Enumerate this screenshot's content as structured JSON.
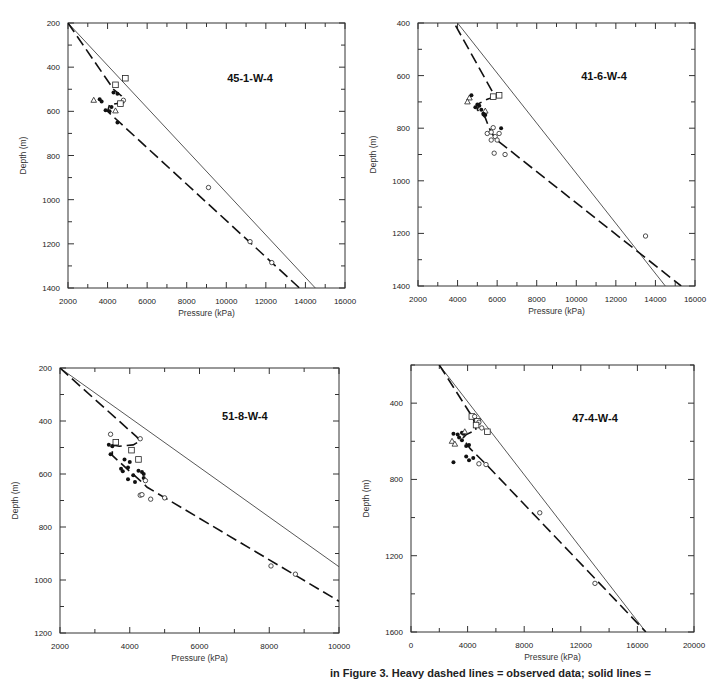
{
  "figure": {
    "caption_partial": "in Figure 3. Heavy dashed lines = observed data; solid lines ="
  },
  "chart_data": [
    {
      "type": "scatter",
      "title": "45-1-W-4",
      "xlabel": "Pressure (kPa)",
      "ylabel": "Depth (m)",
      "xlim": [
        2000,
        16000
      ],
      "ylim": [
        200,
        1400
      ],
      "y_inverted": true,
      "xticks": [
        2000,
        4000,
        6000,
        8000,
        10000,
        12000,
        14000,
        16000
      ],
      "yticks": [
        200,
        400,
        600,
        800,
        1000,
        1200,
        1400
      ],
      "box": {
        "left": 68,
        "right": 345,
        "top": 23,
        "bottom": 288
      },
      "title_pos": {
        "x": 11200,
        "y": 450
      },
      "solid_line": [
        [
          2000,
          200
        ],
        [
          14500,
          1400
        ]
      ],
      "dashed_line": [
        [
          2000,
          200
        ],
        [
          4300,
          500
        ],
        [
          4700,
          530
        ],
        [
          4800,
          560
        ],
        [
          4100,
          570
        ],
        [
          4000,
          600
        ],
        [
          13700,
          1400
        ]
      ],
      "points": [
        {
          "shape": "square",
          "x": 4900,
          "y": 450
        },
        {
          "shape": "square",
          "x": 4400,
          "y": 480
        },
        {
          "shape": "circle-filled",
          "x": 4300,
          "y": 515
        },
        {
          "shape": "circle-filled",
          "x": 4500,
          "y": 520
        },
        {
          "shape": "triangle",
          "x": 3300,
          "y": 550
        },
        {
          "shape": "circle-filled",
          "x": 3600,
          "y": 545
        },
        {
          "shape": "circle-filled",
          "x": 3700,
          "y": 555
        },
        {
          "shape": "circle",
          "x": 4800,
          "y": 550
        },
        {
          "shape": "square",
          "x": 4650,
          "y": 565
        },
        {
          "shape": "circle-filled",
          "x": 4200,
          "y": 580
        },
        {
          "shape": "circle-filled",
          "x": 3900,
          "y": 595
        },
        {
          "shape": "circle-filled",
          "x": 4100,
          "y": 600
        },
        {
          "shape": "triangle",
          "x": 4400,
          "y": 598
        },
        {
          "shape": "circle-filled",
          "x": 4500,
          "y": 650
        },
        {
          "shape": "circle",
          "x": 9100,
          "y": 945
        },
        {
          "shape": "circle",
          "x": 11200,
          "y": 1190
        },
        {
          "shape": "circle",
          "x": 12300,
          "y": 1285
        }
      ]
    },
    {
      "type": "scatter",
      "title": "41-6-W-4",
      "xlabel": "Pressure (kPa)",
      "ylabel": "Depth (m)",
      "xlim": [
        2000,
        16000
      ],
      "ylim": [
        400,
        1400
      ],
      "y_inverted": true,
      "xticks": [
        2000,
        4000,
        6000,
        8000,
        10000,
        12000,
        14000,
        16000
      ],
      "yticks": [
        400,
        600,
        800,
        1000,
        1200,
        1400
      ],
      "box": {
        "left": 418,
        "right": 695,
        "top": 23,
        "bottom": 286
      },
      "title_pos": {
        "x": 11400,
        "y": 600
      },
      "solid_line": [
        [
          4000,
          400
        ],
        [
          14500,
          1400
        ]
      ],
      "dashed_line": [
        [
          3900,
          410
        ],
        [
          5900,
          680
        ],
        [
          5500,
          690
        ],
        [
          5100,
          705
        ],
        [
          5000,
          730
        ],
        [
          5400,
          760
        ],
        [
          5600,
          800
        ],
        [
          5900,
          840
        ],
        [
          15300,
          1400
        ]
      ],
      "points": [
        {
          "shape": "square",
          "x": 6100,
          "y": 675
        },
        {
          "shape": "square",
          "x": 5800,
          "y": 680
        },
        {
          "shape": "triangle",
          "x": 4600,
          "y": 685
        },
        {
          "shape": "circle-filled",
          "x": 4700,
          "y": 675
        },
        {
          "shape": "triangle",
          "x": 4500,
          "y": 700
        },
        {
          "shape": "circle-filled",
          "x": 5000,
          "y": 710
        },
        {
          "shape": "circle-filled",
          "x": 5100,
          "y": 715
        },
        {
          "shape": "circle-filled",
          "x": 4900,
          "y": 720
        },
        {
          "shape": "circle-filled",
          "x": 5200,
          "y": 730
        },
        {
          "shape": "triangle",
          "x": 5400,
          "y": 735
        },
        {
          "shape": "circle-filled",
          "x": 5300,
          "y": 745
        },
        {
          "shape": "circle-filled",
          "x": 5400,
          "y": 750
        },
        {
          "shape": "circle",
          "x": 5800,
          "y": 798
        },
        {
          "shape": "circle-filled",
          "x": 6200,
          "y": 800
        },
        {
          "shape": "circle",
          "x": 5500,
          "y": 820
        },
        {
          "shape": "circle",
          "x": 5700,
          "y": 815
        },
        {
          "shape": "circle",
          "x": 6100,
          "y": 820
        },
        {
          "shape": "circle",
          "x": 5900,
          "y": 832
        },
        {
          "shape": "circle",
          "x": 5700,
          "y": 845
        },
        {
          "shape": "circle",
          "x": 6000,
          "y": 845
        },
        {
          "shape": "circle",
          "x": 5850,
          "y": 895
        },
        {
          "shape": "circle",
          "x": 6400,
          "y": 900
        },
        {
          "shape": "circle",
          "x": 13500,
          "y": 1210
        }
      ]
    },
    {
      "type": "scatter",
      "title": "51-8-W-4",
      "xlabel": "Pressure (kPa)",
      "ylabel": "Depth (m)",
      "xlim": [
        2000,
        10000
      ],
      "ylim": [
        200,
        1200
      ],
      "y_inverted": true,
      "xticks": [
        2000,
        4000,
        6000,
        8000,
        10000
      ],
      "yticks": [
        200,
        400,
        600,
        800,
        1000,
        1200
      ],
      "box": {
        "left": 60,
        "right": 339,
        "top": 368,
        "bottom": 633
      },
      "title_pos": {
        "x": 7300,
        "y": 380
      },
      "solid_line": [
        [
          2000,
          200
        ],
        [
          10000,
          950
        ]
      ],
      "dashed_line": [
        [
          2000,
          200
        ],
        [
          4200,
          460
        ],
        [
          4300,
          475
        ],
        [
          4100,
          490
        ],
        [
          3700,
          495
        ],
        [
          3500,
          490
        ],
        [
          3500,
          530
        ],
        [
          4000,
          590
        ],
        [
          4300,
          625
        ],
        [
          4500,
          650
        ],
        [
          10000,
          1080
        ]
      ],
      "points": [
        {
          "shape": "circle",
          "x": 3450,
          "y": 450
        },
        {
          "shape": "circle",
          "x": 4300,
          "y": 467
        },
        {
          "shape": "square",
          "x": 3600,
          "y": 480
        },
        {
          "shape": "circle-filled",
          "x": 3400,
          "y": 490
        },
        {
          "shape": "circle-filled",
          "x": 3500,
          "y": 495
        },
        {
          "shape": "square",
          "x": 4050,
          "y": 510
        },
        {
          "shape": "circle-filled",
          "x": 3450,
          "y": 525
        },
        {
          "shape": "square",
          "x": 4250,
          "y": 545
        },
        {
          "shape": "circle-filled",
          "x": 3850,
          "y": 545
        },
        {
          "shape": "circle-filled",
          "x": 4000,
          "y": 555
        },
        {
          "shape": "circle-filled",
          "x": 3950,
          "y": 575
        },
        {
          "shape": "circle-filled",
          "x": 3750,
          "y": 580
        },
        {
          "shape": "circle-filled",
          "x": 3800,
          "y": 590
        },
        {
          "shape": "circle-filled",
          "x": 4250,
          "y": 588
        },
        {
          "shape": "circle-filled",
          "x": 4350,
          "y": 592
        },
        {
          "shape": "circle-filled",
          "x": 4400,
          "y": 600
        },
        {
          "shape": "circle-filled",
          "x": 4100,
          "y": 605
        },
        {
          "shape": "circle-filled",
          "x": 4400,
          "y": 615
        },
        {
          "shape": "circle-filled",
          "x": 3950,
          "y": 620
        },
        {
          "shape": "circle",
          "x": 4450,
          "y": 625
        },
        {
          "shape": "circle-filled",
          "x": 4150,
          "y": 630
        },
        {
          "shape": "circle",
          "x": 4300,
          "y": 680
        },
        {
          "shape": "circle",
          "x": 4350,
          "y": 678
        },
        {
          "shape": "circle",
          "x": 4600,
          "y": 695
        },
        {
          "shape": "circle",
          "x": 5000,
          "y": 690
        },
        {
          "shape": "circle",
          "x": 8050,
          "y": 947
        },
        {
          "shape": "circle",
          "x": 8750,
          "y": 978
        }
      ]
    },
    {
      "type": "scatter",
      "title": "47-4-W-4",
      "xlabel": "Pressure (kPa)",
      "ylabel": "Depth (m)",
      "xlim": [
        0,
        20000
      ],
      "ylim": [
        200,
        1600
      ],
      "y_inverted": true,
      "xticks": [
        0,
        4000,
        8000,
        12000,
        16000,
        20000
      ],
      "yticks": [
        400,
        800,
        1200,
        1600
      ],
      "minor_yticks": [
        200,
        600,
        1000,
        1400
      ],
      "box": {
        "left": 411,
        "right": 694,
        "top": 365,
        "bottom": 632
      },
      "title_pos": {
        "x": 13000,
        "y": 480
      },
      "solid_line": [
        [
          2000,
          200
        ],
        [
          16600,
          1600
        ]
      ],
      "dashed_line": [
        [
          2000,
          200
        ],
        [
          4400,
          480
        ],
        [
          4600,
          540
        ],
        [
          3900,
          565
        ],
        [
          3700,
          580
        ],
        [
          3800,
          600
        ],
        [
          4200,
          640
        ],
        [
          5300,
          720
        ],
        [
          16600,
          1600
        ]
      ],
      "points": [
        {
          "shape": "square",
          "x": 4300,
          "y": 470
        },
        {
          "shape": "circle",
          "x": 4500,
          "y": 470
        },
        {
          "shape": "square",
          "x": 4700,
          "y": 495
        },
        {
          "shape": "circle",
          "x": 4800,
          "y": 500
        },
        {
          "shape": "square",
          "x": 4600,
          "y": 515
        },
        {
          "shape": "circle",
          "x": 5000,
          "y": 530
        },
        {
          "shape": "square",
          "x": 5400,
          "y": 550
        },
        {
          "shape": "circle-filled",
          "x": 3000,
          "y": 560
        },
        {
          "shape": "circle-filled",
          "x": 3300,
          "y": 565
        },
        {
          "shape": "circle-filled",
          "x": 3600,
          "y": 555
        },
        {
          "shape": "circle-filled",
          "x": 3700,
          "y": 560
        },
        {
          "shape": "triangle",
          "x": 3800,
          "y": 550
        },
        {
          "shape": "circle-filled",
          "x": 3400,
          "y": 580
        },
        {
          "shape": "circle-filled",
          "x": 3600,
          "y": 595
        },
        {
          "shape": "triangle",
          "x": 2900,
          "y": 600
        },
        {
          "shape": "triangle",
          "x": 3100,
          "y": 615
        },
        {
          "shape": "circle-filled",
          "x": 3900,
          "y": 625
        },
        {
          "shape": "circle-filled",
          "x": 4100,
          "y": 620
        },
        {
          "shape": "circle-filled",
          "x": 3900,
          "y": 680
        },
        {
          "shape": "circle-filled",
          "x": 4100,
          "y": 700
        },
        {
          "shape": "circle-filled",
          "x": 4400,
          "y": 688
        },
        {
          "shape": "circle-filled",
          "x": 3000,
          "y": 710
        },
        {
          "shape": "circle",
          "x": 4800,
          "y": 718
        },
        {
          "shape": "circle",
          "x": 5300,
          "y": 722
        },
        {
          "shape": "circle",
          "x": 9100,
          "y": 975
        },
        {
          "shape": "circle",
          "x": 13000,
          "y": 1345
        }
      ]
    }
  ]
}
